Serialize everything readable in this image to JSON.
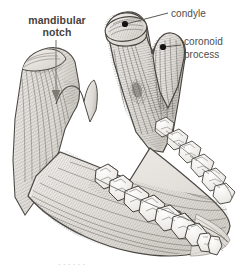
{
  "figure": {
    "style": "grayscale engraving / cross-hatched line art",
    "background_color": "#ffffff",
    "ink_color": "#3a3a3a",
    "bone_fill": "#e8e6e2",
    "bone_shadow": "#9a968f"
  },
  "labels": {
    "mandibular_notch": {
      "line1": "mandibular",
      "line2": "notch",
      "color": "#46433e",
      "weight": "bold",
      "pointer": "arrow"
    },
    "condyle": {
      "text": "condyle",
      "color": "#4f4c47",
      "weight": "normal",
      "pointer": "leader-line-with-dot"
    },
    "coronoid_process": {
      "line1": "coronoid",
      "line2": "process",
      "color": "#4f4c47",
      "weight": "normal",
      "pointer": "leader-line-with-dot"
    }
  },
  "bottom_fragment": {
    "text": "· · · · · ·"
  }
}
